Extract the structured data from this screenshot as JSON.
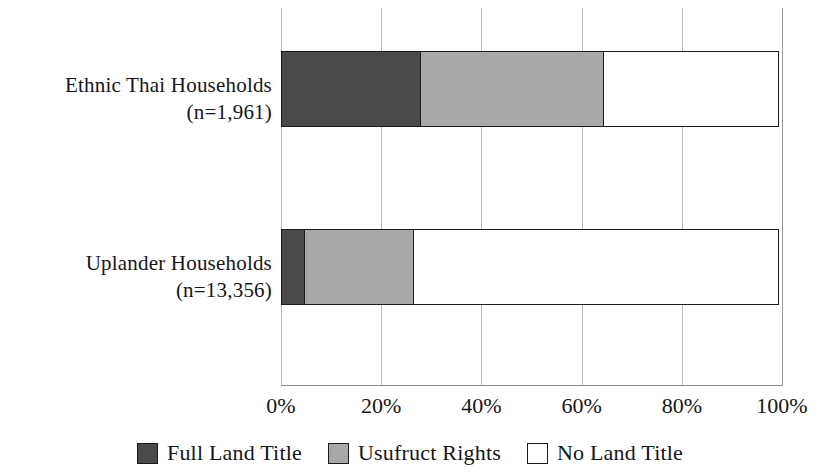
{
  "chart_data": {
    "type": "bar",
    "orientation": "horizontal",
    "stacked": true,
    "normalized": true,
    "title": "",
    "xlabel": "",
    "ylabel": "",
    "xlim": [
      0,
      100
    ],
    "xticks": [
      0,
      20,
      40,
      60,
      80,
      100
    ],
    "xticklabels": [
      "0%",
      "20%",
      "40%",
      "60%",
      "80%",
      "100%"
    ],
    "grid": "vertical-only",
    "legend_position": "bottom-center",
    "categories": [
      "Ethnic Thai Households (n=1,961)",
      "Uplander Households (n=13,356)"
    ],
    "series": [
      {
        "name": "Full Land Title",
        "color": "#4a4a4a",
        "values": [
          28,
          5
        ]
      },
      {
        "name": "Usufruct Rights",
        "color": "#a8a8a8",
        "values": [
          37,
          22
        ]
      },
      {
        "name": "No Land Title",
        "color": "#ffffff",
        "values": [
          35,
          73
        ]
      }
    ]
  },
  "labels": {
    "ethnic": {
      "line1": "Ethnic Thai Households",
      "line2": "(n=1,961)"
    },
    "uplander": {
      "line1": "Uplander Households",
      "line2": "(n=13,356)"
    }
  },
  "axis": {
    "ticks": [
      {
        "label": "0%",
        "value": 0
      },
      {
        "label": "20%",
        "value": 20
      },
      {
        "label": "40%",
        "value": 40
      },
      {
        "label": "60%",
        "value": 60
      },
      {
        "label": "80%",
        "value": 80
      },
      {
        "label": "100%",
        "value": 100
      }
    ]
  },
  "legend": {
    "items": [
      {
        "label": "Full Land Title",
        "swatch": "legend-swatch-full-land-title",
        "color": "#4a4a4a"
      },
      {
        "label": "Usufruct Rights",
        "swatch": "legend-swatch-usufruct-rights",
        "color": "#a8a8a8"
      },
      {
        "label": "No Land Title",
        "swatch": "legend-swatch-no-land-title",
        "color": "#ffffff"
      }
    ]
  }
}
